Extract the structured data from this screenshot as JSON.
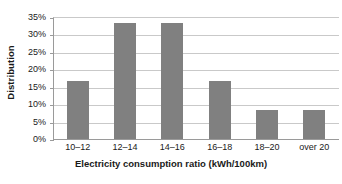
{
  "chart_data": {
    "type": "bar",
    "title": "",
    "categories": [
      "10–12",
      "12–14",
      "14–16",
      "16–18",
      "18–20",
      "over 20"
    ],
    "values": [
      16.7,
      33.3,
      33.3,
      16.7,
      8.3,
      8.3
    ],
    "xlabel": "Electricity consumption ratio (kWh/100km)",
    "ylabel": "Distribution",
    "ylim": [
      0,
      35
    ],
    "yticks": [
      0,
      5,
      10,
      15,
      20,
      25,
      30,
      35
    ],
    "ytick_labels": [
      "0%",
      "5%",
      "10%",
      "15%",
      "20%",
      "25%",
      "30%",
      "35%"
    ],
    "grid": true,
    "legend": null,
    "bar_color": "#808080",
    "gridline_color": "#c9c9c9",
    "axis_color": "#9a9a9a",
    "background_color": "#ffffff",
    "value_unit": "%"
  }
}
